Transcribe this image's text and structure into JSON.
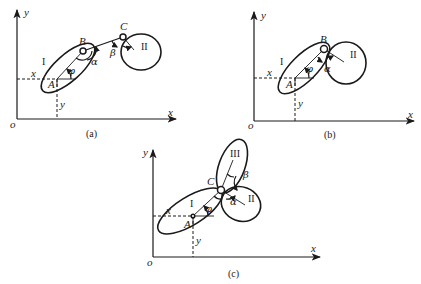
{
  "figure": {
    "panels": [
      {
        "id": "a",
        "caption": "(a)",
        "axes": {
          "x_label": "x",
          "y_label": "y",
          "origin_label": "o"
        },
        "local_coords": {
          "x_label": "x",
          "y_label": "y"
        },
        "points": {
          "A": "A",
          "B": "B",
          "C": "C"
        },
        "bodies": [
          "I",
          "II"
        ],
        "angles": [
          "φ",
          "α",
          "β"
        ]
      },
      {
        "id": "b",
        "caption": "(b)",
        "axes": {
          "x_label": "x",
          "y_label": "y",
          "origin_label": "o"
        },
        "local_coords": {
          "x_label": "x",
          "y_label": "y"
        },
        "points": {
          "A": "A",
          "B": "B"
        },
        "bodies": [
          "I",
          "II"
        ],
        "angles": [
          "φ",
          "α"
        ]
      },
      {
        "id": "c",
        "caption": "(c)",
        "axes": {
          "x_label": "x",
          "y_label": "y",
          "origin_label": "o"
        },
        "local_coords": {
          "x_label": "x",
          "y_label": "y"
        },
        "points": {
          "A": "A",
          "C": "C"
        },
        "bodies": [
          "I",
          "II",
          "III"
        ],
        "angles": [
          "φ",
          "α",
          "β"
        ]
      }
    ]
  }
}
